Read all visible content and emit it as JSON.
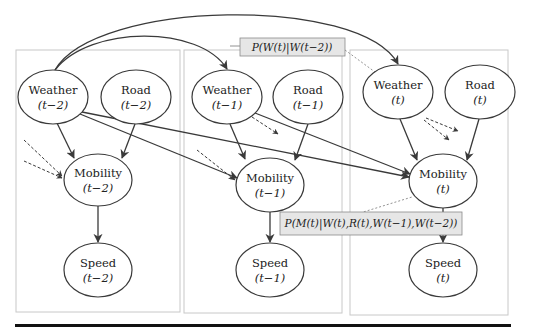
{
  "diagram": {
    "type": "dynamic-bayesian-network",
    "colors": {
      "panel_border": "#c8c8c8",
      "edge": "#3a3a3a",
      "label_box_fill": "#e6e6e6",
      "label_box_border": "#8a8a8a",
      "bottom_rule": "#111111"
    },
    "panels": [
      {
        "id": "slice-t-2",
        "x": 16,
        "y": 50,
        "w": 164,
        "h": 262
      },
      {
        "id": "slice-t-1",
        "x": 184,
        "y": 50,
        "w": 158,
        "h": 263
      },
      {
        "id": "slice-t",
        "x": 350,
        "y": 50,
        "w": 158,
        "h": 265
      }
    ],
    "nodes": [
      {
        "id": "weather_t2",
        "title": "Weather",
        "sub": "(t−2)",
        "cx": 53,
        "cy": 97,
        "rx": 35,
        "ry": 27
      },
      {
        "id": "road_t2",
        "title": "Road",
        "sub": "(t−2)",
        "cx": 136,
        "cy": 97,
        "rx": 35,
        "ry": 27
      },
      {
        "id": "mobility_t2",
        "title": "Mobility",
        "sub": "(t−2)",
        "cx": 98,
        "cy": 180,
        "rx": 34,
        "ry": 26
      },
      {
        "id": "speed_t2",
        "title": "Speed",
        "sub": "(t−2)",
        "cx": 98,
        "cy": 270,
        "rx": 34,
        "ry": 27
      },
      {
        "id": "weather_t1",
        "title": "Weather",
        "sub": "(t−1)",
        "cx": 227,
        "cy": 97,
        "rx": 35,
        "ry": 27
      },
      {
        "id": "road_t1",
        "title": "Road",
        "sub": "(t−1)",
        "cx": 308,
        "cy": 97,
        "rx": 35,
        "ry": 27
      },
      {
        "id": "mobility_t1",
        "title": "Mobility",
        "sub": "(t−1)",
        "cx": 270,
        "cy": 185,
        "rx": 34,
        "ry": 27
      },
      {
        "id": "speed_t1",
        "title": "Speed",
        "sub": "(t−1)",
        "cx": 270,
        "cy": 270,
        "rx": 34,
        "ry": 27
      },
      {
        "id": "weather_t",
        "title": "Weather",
        "sub": "(t)",
        "cx": 398,
        "cy": 92,
        "rx": 35,
        "ry": 27
      },
      {
        "id": "road_t",
        "title": "Road",
        "sub": "(t)",
        "cx": 480,
        "cy": 92,
        "rx": 35,
        "ry": 27
      },
      {
        "id": "mobility_t",
        "title": "Mobility",
        "sub": "(t)",
        "cx": 443,
        "cy": 181,
        "rx": 34,
        "ry": 27
      },
      {
        "id": "speed_t",
        "title": "Speed",
        "sub": "(t)",
        "cx": 443,
        "cy": 270,
        "rx": 34,
        "ry": 27
      }
    ],
    "edges": [
      {
        "from": "weather_t2",
        "to": "mobility_t2",
        "style": "solid"
      },
      {
        "from": "road_t2",
        "to": "mobility_t2",
        "style": "solid"
      },
      {
        "from": "mobility_t2",
        "to": "speed_t2",
        "style": "solid"
      },
      {
        "from": "weather_t1",
        "to": "mobility_t1",
        "style": "solid"
      },
      {
        "from": "road_t1",
        "to": "mobility_t1",
        "style": "solid"
      },
      {
        "from": "mobility_t1",
        "to": "speed_t1",
        "style": "solid"
      },
      {
        "from": "weather_t",
        "to": "mobility_t",
        "style": "solid"
      },
      {
        "from": "road_t",
        "to": "mobility_t",
        "style": "solid"
      },
      {
        "from": "mobility_t",
        "to": "speed_t",
        "style": "solid"
      },
      {
        "from": "weather_t2",
        "to": "mobility_t1",
        "style": "solid"
      },
      {
        "from": "weather_t2",
        "to": "mobility_t",
        "style": "solid"
      },
      {
        "from": "weather_t1",
        "to": "mobility_t",
        "style": "solid"
      },
      {
        "from": "weather_t2",
        "to": "weather_t1",
        "style": "solid-curved"
      },
      {
        "from": "weather_t2",
        "to": "weather_t",
        "style": "solid-curved"
      }
    ],
    "dashed_stubs": [
      "incoming to mobility_t2 (from earlier slices)",
      "incoming to mobility_t1 (from earlier slice)",
      "outgoing from weather_t1 (to future)",
      "outgoing from weather_t (to future slices)"
    ],
    "annotations": [
      {
        "id": "weather-transition",
        "text": "P(W(t)|W(t−2))"
      },
      {
        "id": "mobility-conditional",
        "text": "P(M(t)|W(t),R(t),W(t−1),W(t−2))"
      }
    ]
  }
}
